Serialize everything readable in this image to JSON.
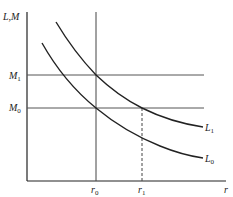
{
  "diagram": {
    "y_axis_label": "L,M",
    "x_axis_label": "r",
    "horizontal_lines": [
      {
        "label": "M",
        "subscript": "1"
      },
      {
        "label": "M",
        "subscript": "0"
      }
    ],
    "vertical_lines": [
      {
        "label": "r",
        "subscript": "0",
        "style": "solid"
      },
      {
        "label": "r",
        "subscript": "1",
        "style": "dashed"
      }
    ],
    "curves": [
      {
        "label": "L",
        "subscript": "1"
      },
      {
        "label": "L",
        "subscript": "0"
      }
    ],
    "colors": {
      "line": "#222222",
      "guide": "#555555"
    }
  }
}
